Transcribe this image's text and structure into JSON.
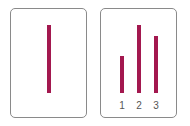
{
  "panels": [
    {
      "name": "single-bar-panel",
      "bars": [
        {
          "label": "",
          "height": 68
        }
      ]
    },
    {
      "name": "three-bar-panel",
      "bars": [
        {
          "label": "1",
          "height": 37
        },
        {
          "label": "2",
          "height": 68
        },
        {
          "label": "3",
          "height": 57
        }
      ]
    }
  ],
  "colors": {
    "bar": "#a3184f",
    "border": "#8a8a8a"
  }
}
